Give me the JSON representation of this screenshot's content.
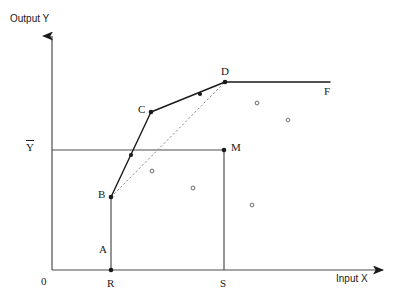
{
  "figure": {
    "axis_label_y": "Output Y",
    "axis_label_x": "Input X",
    "origin_label": "0",
    "mean_output_label": "Y"
  },
  "point_labels": {
    "A": "A",
    "B": "B",
    "C": "C",
    "D": "D",
    "F": "F",
    "M": "M",
    "R": "R",
    "S": "S"
  },
  "chart_data": {
    "type": "scatter",
    "title": "",
    "xlabel": "Input X",
    "ylabel": "Output Y",
    "xlim": [
      0,
      1
    ],
    "ylim": [
      0,
      1
    ],
    "grid": false,
    "legend": "none",
    "axes": {
      "y_axis_x_px": 52,
      "x_axis_y_px": 270,
      "y_arrow_tip_px": 30,
      "x_arrow_tip_px": 390
    },
    "named_points": [
      {
        "name": "A",
        "x_px": 111,
        "y_px": 250,
        "marker": "none",
        "label_dx": -12,
        "label_dy": 0
      },
      {
        "name": "B",
        "x_px": 111,
        "y_px": 197,
        "marker": "filled",
        "label_dx": -13,
        "label_dy": -2
      },
      {
        "name": "C",
        "x_px": 151,
        "y_px": 112,
        "marker": "filled",
        "label_dx": -13,
        "label_dy": -2
      },
      {
        "name": "D",
        "x_px": 225,
        "y_px": 82,
        "marker": "filled",
        "label_dx": -4,
        "label_dy": -10
      },
      {
        "name": "F",
        "x_px": 330,
        "y_px": 82,
        "marker": "none",
        "label_dx": -6,
        "label_dy": 10
      },
      {
        "name": "M",
        "x_px": 224,
        "y_px": 150,
        "marker": "filled",
        "label_dx": 7,
        "label_dy": -2
      },
      {
        "name": "R",
        "x_px": 111,
        "y_px": 270,
        "marker": "filled",
        "label_dx": -4,
        "label_dy": 14
      },
      {
        "name": "S",
        "x_px": 224,
        "y_px": 270,
        "marker": "none",
        "label_dx": -4,
        "label_dy": 14
      }
    ],
    "frontier_path": [
      {
        "x_px": 111,
        "y_px": 197
      },
      {
        "x_px": 151,
        "y_px": 112
      },
      {
        "x_px": 225,
        "y_px": 82
      },
      {
        "x_px": 330,
        "y_px": 82
      }
    ],
    "frontier_interior_markers": [
      {
        "x_px": 131,
        "y_px": 155
      },
      {
        "x_px": 200,
        "y_px": 94
      }
    ],
    "dashed_chord": {
      "x1_px": 111,
      "y1_px": 197,
      "x2_px": 225,
      "y2_px": 82
    },
    "mean_output_line": {
      "y_px": 150,
      "x1_px": 52,
      "x2_px": 224
    },
    "vertical_segments": [
      {
        "x_px": 111,
        "y1_px": 197,
        "y2_px": 270
      },
      {
        "x_px": 224,
        "y1_px": 150,
        "y2_px": 270
      }
    ],
    "scatter_points": [
      {
        "x_px": 152,
        "y_px": 171
      },
      {
        "x_px": 193,
        "y_px": 188
      },
      {
        "x_px": 257,
        "y_px": 103
      },
      {
        "x_px": 288,
        "y_px": 120
      },
      {
        "x_px": 252,
        "y_px": 205
      }
    ],
    "colors": {
      "line": "#1a1a1a",
      "axis": "#4d4d4d",
      "marker_fill": "#1a1a1a",
      "scatter_stroke": "#6b6b6b",
      "background": "#ffffff"
    }
  }
}
